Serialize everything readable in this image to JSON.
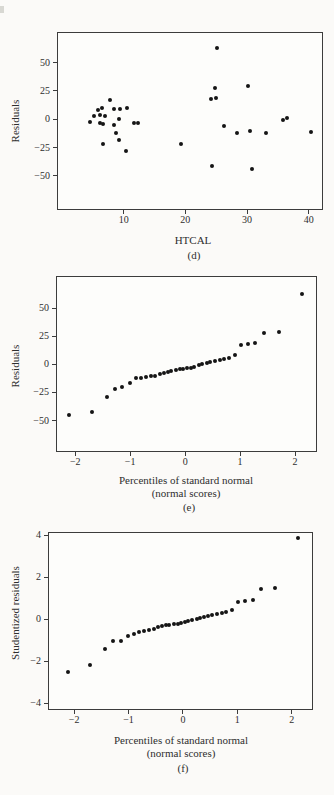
{
  "figure": {
    "background": "#fbfaf8",
    "plot_background": "#fdfdfb",
    "axis_color": "#3c3c3c",
    "dot_color": "#151515",
    "text_color": "#2e2e2e"
  },
  "chart_data": [
    {
      "id": "d",
      "type": "scatter",
      "xlabel": "HTCAL",
      "xlabel2": "",
      "ylabel": "Residuals",
      "caption": "(d)",
      "grid": false,
      "legend": null,
      "xlim": [
        -0.8,
        42.3
      ],
      "ylim": [
        -80,
        77
      ],
      "xticks": [
        {
          "v": 10,
          "label": "10"
        },
        {
          "v": 20,
          "label": "20"
        },
        {
          "v": 30,
          "label": "30"
        },
        {
          "v": 40,
          "label": "40"
        }
      ],
      "yticks": [
        {
          "v": 50,
          "label": "50"
        },
        {
          "v": 25,
          "label": "25"
        },
        {
          "v": 0,
          "label": "0"
        },
        {
          "v": -25,
          "label": "−25"
        },
        {
          "v": -50,
          "label": "−50"
        }
      ],
      "points": [
        [
          4.6,
          -2
        ],
        [
          5.2,
          3
        ],
        [
          5.8,
          8
        ],
        [
          6.2,
          4
        ],
        [
          6.2,
          -3
        ],
        [
          6.5,
          10
        ],
        [
          6.6,
          -4
        ],
        [
          6.7,
          -22
        ],
        [
          7.0,
          3
        ],
        [
          7.8,
          17
        ],
        [
          8.4,
          -5
        ],
        [
          8.5,
          9
        ],
        [
          8.7,
          -12
        ],
        [
          9.2,
          0
        ],
        [
          9.2,
          -18
        ],
        [
          9.4,
          9
        ],
        [
          10.3,
          -28
        ],
        [
          10.6,
          10
        ],
        [
          11.7,
          -3
        ],
        [
          12.3,
          -3
        ],
        [
          19.3,
          -22
        ],
        [
          24.1,
          18
        ],
        [
          24.3,
          -41
        ],
        [
          24.8,
          28
        ],
        [
          24.9,
          19
        ],
        [
          25.1,
          63
        ],
        [
          26.2,
          -6
        ],
        [
          28.4,
          -12
        ],
        [
          30.1,
          29
        ],
        [
          30.4,
          -10
        ],
        [
          30.8,
          -44
        ],
        [
          33.1,
          -12
        ],
        [
          35.8,
          -1
        ],
        [
          36.5,
          1
        ],
        [
          40.3,
          -11
        ]
      ]
    },
    {
      "id": "e",
      "type": "scatter",
      "xlabel": "Percentiles of standard normal",
      "xlabel2": "(normal scores)",
      "ylabel": "Residuals",
      "caption": "(e)",
      "grid": false,
      "legend": null,
      "xlim": [
        -2.35,
        2.4
      ],
      "ylim": [
        -78,
        78.6
      ],
      "xticks": [
        {
          "v": -2,
          "label": "−2"
        },
        {
          "v": -1,
          "label": "−1"
        },
        {
          "v": 0,
          "label": "0"
        },
        {
          "v": 1,
          "label": "1"
        },
        {
          "v": 2,
          "label": "2"
        }
      ],
      "yticks": [
        {
          "v": 50,
          "label": "50"
        },
        {
          "v": 25,
          "label": "25"
        },
        {
          "v": 0,
          "label": "0"
        },
        {
          "v": -25,
          "label": "−25"
        },
        {
          "v": -50,
          "label": "−50"
        }
      ],
      "points": [
        [
          -2.12,
          -45
        ],
        [
          -1.7,
          -42
        ],
        [
          -1.43,
          -29
        ],
        [
          -1.28,
          -22
        ],
        [
          -1.14,
          -20
        ],
        [
          -1.01,
          -17
        ],
        [
          -0.9,
          -12
        ],
        [
          -0.8,
          -12
        ],
        [
          -0.71,
          -11
        ],
        [
          -0.63,
          -10
        ],
        [
          -0.54,
          -10
        ],
        [
          -0.46,
          -9
        ],
        [
          -0.39,
          -8
        ],
        [
          -0.31,
          -7
        ],
        [
          -0.25,
          -6
        ],
        [
          -0.17,
          -5
        ],
        [
          -0.1,
          -4
        ],
        [
          -0.03,
          -4
        ],
        [
          0.03,
          -3
        ],
        [
          0.1,
          -3
        ],
        [
          0.17,
          -2
        ],
        [
          0.25,
          -1
        ],
        [
          0.31,
          0
        ],
        [
          0.39,
          1
        ],
        [
          0.46,
          2
        ],
        [
          0.54,
          3
        ],
        [
          0.63,
          4
        ],
        [
          0.71,
          5
        ],
        [
          0.8,
          6
        ],
        [
          0.9,
          8
        ],
        [
          1.01,
          17
        ],
        [
          1.14,
          18
        ],
        [
          1.28,
          19
        ],
        [
          1.43,
          28
        ],
        [
          1.7,
          29
        ],
        [
          2.12,
          63
        ]
      ]
    },
    {
      "id": "f",
      "type": "scatter",
      "xlabel": "Percentiles of standard normal",
      "xlabel2": "(normal scores)",
      "ylabel": "Studentized residuals",
      "caption": "(f)",
      "grid": false,
      "legend": null,
      "xlim": [
        -2.48,
        2.39
      ],
      "ylim": [
        -4.31,
        4.15
      ],
      "xticks": [
        {
          "v": -2,
          "label": "−2"
        },
        {
          "v": -1,
          "label": "−1"
        },
        {
          "v": 0,
          "label": "0"
        },
        {
          "v": 1,
          "label": "1"
        },
        {
          "v": 2,
          "label": "2"
        }
      ],
      "yticks": [
        {
          "v": 4,
          "label": "4"
        },
        {
          "v": 2,
          "label": "2"
        },
        {
          "v": 0,
          "label": "0"
        },
        {
          "v": -2,
          "label": "−2"
        },
        {
          "v": -4,
          "label": "−4"
        }
      ],
      "points": [
        [
          -2.12,
          -2.5
        ],
        [
          -1.7,
          -2.15
        ],
        [
          -1.43,
          -1.4
        ],
        [
          -1.28,
          -1.05
        ],
        [
          -1.14,
          -1.05
        ],
        [
          -1.01,
          -0.8
        ],
        [
          -0.9,
          -0.7
        ],
        [
          -0.8,
          -0.62
        ],
        [
          -0.71,
          -0.55
        ],
        [
          -0.63,
          -0.5
        ],
        [
          -0.54,
          -0.45
        ],
        [
          -0.46,
          -0.38
        ],
        [
          -0.39,
          -0.32
        ],
        [
          -0.31,
          -0.28
        ],
        [
          -0.25,
          -0.25
        ],
        [
          -0.17,
          -0.23
        ],
        [
          -0.1,
          -0.2
        ],
        [
          -0.03,
          -0.18
        ],
        [
          0.03,
          -0.15
        ],
        [
          0.1,
          -0.1
        ],
        [
          0.17,
          -0.05
        ],
        [
          0.25,
          0.0
        ],
        [
          0.31,
          0.05
        ],
        [
          0.39,
          0.1
        ],
        [
          0.46,
          0.15
        ],
        [
          0.54,
          0.2
        ],
        [
          0.63,
          0.25
        ],
        [
          0.71,
          0.3
        ],
        [
          0.8,
          0.35
        ],
        [
          0.9,
          0.42
        ],
        [
          1.01,
          0.8
        ],
        [
          1.14,
          0.87
        ],
        [
          1.28,
          0.92
        ],
        [
          1.43,
          1.45
        ],
        [
          1.7,
          1.5
        ],
        [
          2.12,
          3.85
        ]
      ]
    }
  ]
}
